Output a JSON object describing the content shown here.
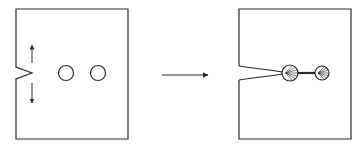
{
  "diagram": {
    "colors": {
      "stroke": "#2a2a2a",
      "background": "#ffffff"
    },
    "before_panel": {
      "label": "before",
      "box": {
        "x": 16,
        "y": 9,
        "w": 112,
        "h": 130
      },
      "notch": {
        "top_y": 67,
        "tip_x": 32,
        "tip_y": 73,
        "bottom_y": 79
      },
      "load_arrows": [
        {
          "direction": "up",
          "x": 32,
          "y1": 63,
          "y2": 45
        },
        {
          "direction": "down",
          "x": 32,
          "y1": 83,
          "y2": 103
        }
      ],
      "holes": [
        {
          "cx": 66,
          "cy": 73,
          "r": 7.5
        },
        {
          "cx": 98,
          "cy": 73,
          "r": 7.5
        }
      ]
    },
    "transition_arrow": {
      "x1": 162,
      "x2": 208,
      "y": 75,
      "direction": "right"
    },
    "after_panel": {
      "label": "after",
      "box": {
        "x": 239,
        "y": 9,
        "w": 112,
        "h": 130
      },
      "crack_mouth": {
        "top_y": 66,
        "bottom_y": 80
      },
      "voids": [
        {
          "cx": 290,
          "cy": 73,
          "r": 8
        },
        {
          "cx": 322,
          "cy": 73,
          "r": 7
        }
      ],
      "ligament": {
        "x1": 298,
        "x2": 315,
        "y": 73
      }
    }
  }
}
